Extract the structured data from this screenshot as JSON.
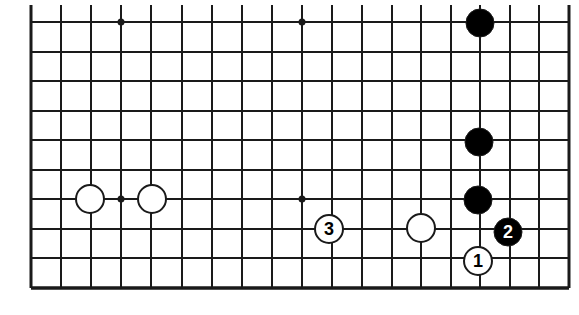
{
  "figure": {
    "type": "go-board-diagram",
    "background_color": "#ffffff",
    "line_color": "#1a1a1a",
    "black_color": "#000000",
    "white_color": "#ffffff"
  },
  "board": {
    "left": 31,
    "top": 22,
    "right": 569,
    "bottom": 288,
    "column_count": 19,
    "row_count": 10,
    "cell_size": 29.9,
    "columns_x": [
      31,
      61,
      91,
      121,
      151,
      182,
      212,
      242,
      272,
      302,
      332,
      362,
      392,
      421,
      451,
      480,
      510,
      539,
      569
    ],
    "rows_y": [
      22,
      52,
      81,
      111,
      140,
      170,
      199,
      229,
      258,
      288
    ],
    "border_width": 3,
    "grid_width": 2,
    "top_stub_y": 5,
    "note": "partial board, lines extend above first horizontal line"
  },
  "star_points": [
    {
      "name": "star-point-upper-left",
      "x": 121,
      "y": 22
    },
    {
      "name": "star-point-upper-middle",
      "x": 302,
      "y": 22
    },
    {
      "name": "star-point-lower-left",
      "x": 121,
      "y": 199
    },
    {
      "name": "star-point-lower-middle",
      "x": 302,
      "y": 199
    },
    {
      "radius": 3.5
    }
  ],
  "stones": [
    {
      "id": "black-stone-top-right",
      "color": "black",
      "x": 480,
      "y": 23,
      "radius": 14,
      "label": ""
    },
    {
      "id": "black-stone-right-upper",
      "color": "black",
      "x": 479,
      "y": 142,
      "radius": 14,
      "label": ""
    },
    {
      "id": "black-stone-right-lower",
      "color": "black",
      "x": 478,
      "y": 200,
      "radius": 14,
      "label": ""
    },
    {
      "id": "white-stone-left-outer",
      "color": "white",
      "x": 90,
      "y": 199,
      "radius": 14,
      "label": ""
    },
    {
      "id": "white-stone-left-inner",
      "color": "white",
      "x": 152,
      "y": 199,
      "radius": 14,
      "label": ""
    },
    {
      "id": "white-stone-center-right",
      "color": "white",
      "x": 421,
      "y": 228,
      "radius": 14,
      "label": ""
    },
    {
      "id": "white-stone-move-3",
      "color": "white",
      "x": 329,
      "y": 229,
      "radius": 14,
      "label": "3"
    },
    {
      "id": "black-stone-move-2",
      "color": "black",
      "x": 508,
      "y": 232,
      "radius": 14,
      "label": "2"
    },
    {
      "id": "white-stone-move-1",
      "color": "white",
      "x": 478,
      "y": 261,
      "radius": 14,
      "label": "1"
    }
  ],
  "move_labels": {
    "move_1": "1",
    "move_2": "2",
    "move_3": "3"
  }
}
